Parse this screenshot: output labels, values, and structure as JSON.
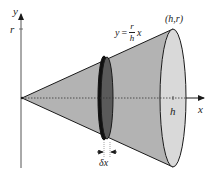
{
  "figure": {
    "axes": {
      "x_label": "x",
      "y_label": "y",
      "y_tick_label": "r",
      "x_tick_label": "h"
    },
    "curve_label": {
      "lhs": "y",
      "equals": "=",
      "numerator": "r",
      "denominator": "h",
      "variable": "x"
    },
    "point_label": "(h,r)",
    "slice_label": "δx",
    "colors": {
      "cone_fill": "#b3b3b3",
      "end_face_fill": "#d9d9d9",
      "disk_fill": "#5a5a5a",
      "outline": "#1a1a1a",
      "axis": "#444444"
    }
  }
}
